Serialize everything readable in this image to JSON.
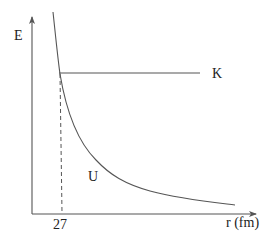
{
  "diagram": {
    "y_axis_label": "E",
    "x_axis_label": "r (fm)",
    "x_marker_label": "27",
    "horizontal_line_label": "K",
    "curve_label": "U",
    "colors": {
      "line": "#555555",
      "text": "#222222",
      "background": "#ffffff"
    }
  }
}
